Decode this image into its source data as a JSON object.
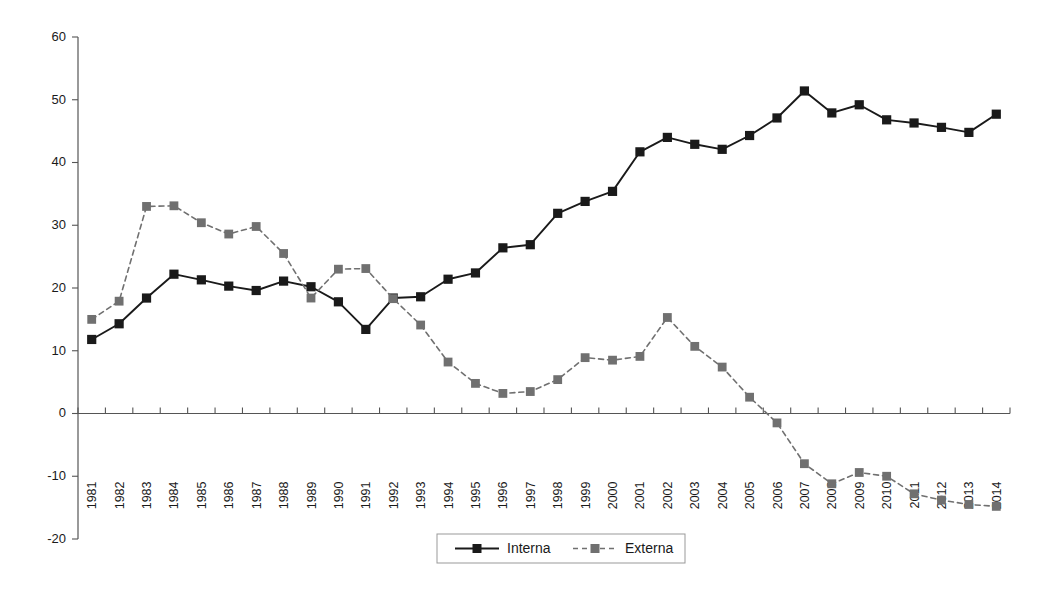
{
  "chart_data": {
    "type": "line",
    "title": "",
    "subtitle": "",
    "xlabel": "",
    "ylabel": "",
    "grid": false,
    "legend_position": "bottom-center",
    "ylim": [
      -20,
      60
    ],
    "ytick_step": 10,
    "yticks": [
      60,
      50,
      40,
      30,
      20,
      10,
      0,
      -10,
      -20
    ],
    "ytick_labels": [
      "60",
      "50",
      "40",
      "30",
      "20",
      "10",
      "0",
      "-10",
      "-20"
    ],
    "categories": [
      "1981",
      "1982",
      "1983",
      "1984",
      "1985",
      "1986",
      "1987",
      "1988",
      "1989",
      "1990",
      "1991",
      "1992",
      "1993",
      "1994",
      "1995",
      "1996",
      "1997",
      "1998",
      "1999",
      "2000",
      "2001",
      "2002",
      "2003",
      "2004",
      "2005",
      "2006",
      "2007",
      "2008",
      "2009",
      "2010",
      "2011",
      "2012",
      "2013",
      "2014"
    ],
    "series": [
      {
        "name": "Interna",
        "color": "#1a1a1a",
        "line_style": "solid",
        "marker": "square",
        "values": [
          11.8,
          14.3,
          18.4,
          22.2,
          21.3,
          20.3,
          19.6,
          21.1,
          20.2,
          17.8,
          13.4,
          18.4,
          18.6,
          21.4,
          22.4,
          26.4,
          26.9,
          31.9,
          33.8,
          35.4,
          41.7,
          44.0,
          42.9,
          42.1,
          44.3,
          47.1,
          51.4,
          47.9,
          49.2,
          46.8,
          46.3,
          45.6,
          44.8,
          47.7
        ]
      },
      {
        "name": "Externa",
        "color": "#707070",
        "line_style": "dashed",
        "marker": "square",
        "values": [
          15.0,
          17.9,
          33.0,
          33.1,
          30.4,
          28.6,
          29.8,
          25.5,
          18.4,
          23.0,
          23.1,
          18.3,
          14.1,
          8.2,
          4.8,
          3.2,
          3.5,
          5.4,
          8.9,
          8.5,
          9.1,
          15.3,
          10.7,
          7.4,
          2.6,
          -1.5,
          -8.0,
          -11.2,
          -9.4,
          -10.0,
          -12.8,
          -13.8,
          -14.5,
          -14.8
        ]
      }
    ]
  },
  "legend": {
    "entries": [
      {
        "label": "Interna",
        "color": "#1a1a1a",
        "style": "solid"
      },
      {
        "label": "Externa",
        "color": "#707070",
        "style": "dashed"
      }
    ]
  }
}
